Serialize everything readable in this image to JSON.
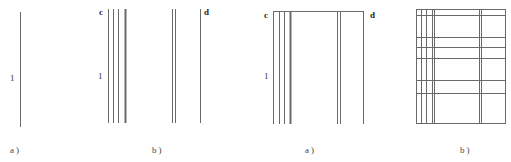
{
  "figure": {
    "stroke_color": "#6a6a6a",
    "panels": [
      {
        "id": "left-a",
        "caption": "a)",
        "caption_pos": [
          10,
          146
        ],
        "labels": [
          {
            "text": "1",
            "pos": [
              10,
              74
            ],
            "bold": false
          }
        ],
        "vlines": [
          {
            "x": 20,
            "y1": 12,
            "y2": 127,
            "w": 1
          }
        ],
        "hlines": []
      },
      {
        "id": "left-b",
        "caption": "b)",
        "caption_pos": [
          152,
          146
        ],
        "labels": [
          {
            "text": "c",
            "pos": [
              99,
              8
            ],
            "bold": true
          },
          {
            "text": "1",
            "pos": [
              98,
              72
            ],
            "bold": false
          },
          {
            "text": "d",
            "pos": [
              204,
              8
            ],
            "bold": true
          }
        ],
        "vlines": [
          {
            "x": 108,
            "y1": 9,
            "y2": 123,
            "w": 1
          },
          {
            "x": 113,
            "y1": 9,
            "y2": 123,
            "w": 1
          },
          {
            "x": 118,
            "y1": 9,
            "y2": 123,
            "w": 1
          },
          {
            "x": 125,
            "y1": 9,
            "y2": 123,
            "w": 2
          },
          {
            "x": 172,
            "y1": 9,
            "y2": 123,
            "w": 1
          },
          {
            "x": 175,
            "y1": 9,
            "y2": 123,
            "w": 1
          },
          {
            "x": 200,
            "y1": 9,
            "y2": 123,
            "w": 1
          }
        ],
        "hlines": []
      },
      {
        "id": "right-a",
        "caption": "a)",
        "caption_pos": [
          305,
          146
        ],
        "labels": [
          {
            "text": "c",
            "pos": [
              264,
              11
            ],
            "bold": true
          },
          {
            "text": "1",
            "pos": [
              264,
              72
            ],
            "bold": false
          },
          {
            "text": "d",
            "pos": [
              370,
              11
            ],
            "bold": true
          }
        ],
        "vlines": [
          {
            "x": 273,
            "y1": 11,
            "y2": 124,
            "w": 1
          },
          {
            "x": 279,
            "y1": 11,
            "y2": 124,
            "w": 1
          },
          {
            "x": 284,
            "y1": 11,
            "y2": 124,
            "w": 1
          },
          {
            "x": 290,
            "y1": 11,
            "y2": 124,
            "w": 2
          },
          {
            "x": 337,
            "y1": 11,
            "y2": 124,
            "w": 1
          },
          {
            "x": 340,
            "y1": 11,
            "y2": 124,
            "w": 1
          },
          {
            "x": 363,
            "y1": 11,
            "y2": 124,
            "w": 1
          }
        ],
        "hlines": [
          {
            "y": 11,
            "x1": 273,
            "x2": 363,
            "w": 1
          }
        ]
      },
      {
        "id": "right-b",
        "caption": "b)",
        "caption_pos": [
          460,
          146
        ],
        "labels": [],
        "vlines": [
          {
            "x": 416,
            "y1": 9,
            "y2": 123,
            "w": 1
          },
          {
            "x": 421,
            "y1": 9,
            "y2": 123,
            "w": 1
          },
          {
            "x": 426,
            "y1": 9,
            "y2": 123,
            "w": 1
          },
          {
            "x": 432,
            "y1": 9,
            "y2": 123,
            "w": 1
          },
          {
            "x": 434,
            "y1": 9,
            "y2": 123,
            "w": 1
          },
          {
            "x": 479,
            "y1": 9,
            "y2": 123,
            "w": 1
          },
          {
            "x": 481,
            "y1": 9,
            "y2": 123,
            "w": 1
          },
          {
            "x": 505,
            "y1": 9,
            "y2": 123,
            "w": 1
          }
        ],
        "hlines": [
          {
            "y": 9,
            "x1": 416,
            "x2": 505,
            "w": 1
          },
          {
            "y": 15,
            "x1": 416,
            "x2": 505,
            "w": 1
          },
          {
            "y": 37,
            "x1": 416,
            "x2": 505,
            "w": 1
          },
          {
            "y": 47,
            "x1": 416,
            "x2": 505,
            "w": 1
          },
          {
            "y": 58,
            "x1": 416,
            "x2": 505,
            "w": 1
          },
          {
            "y": 80,
            "x1": 416,
            "x2": 505,
            "w": 1
          },
          {
            "y": 93,
            "x1": 416,
            "x2": 505,
            "w": 1
          },
          {
            "y": 123,
            "x1": 416,
            "x2": 505,
            "w": 1
          }
        ]
      }
    ]
  }
}
